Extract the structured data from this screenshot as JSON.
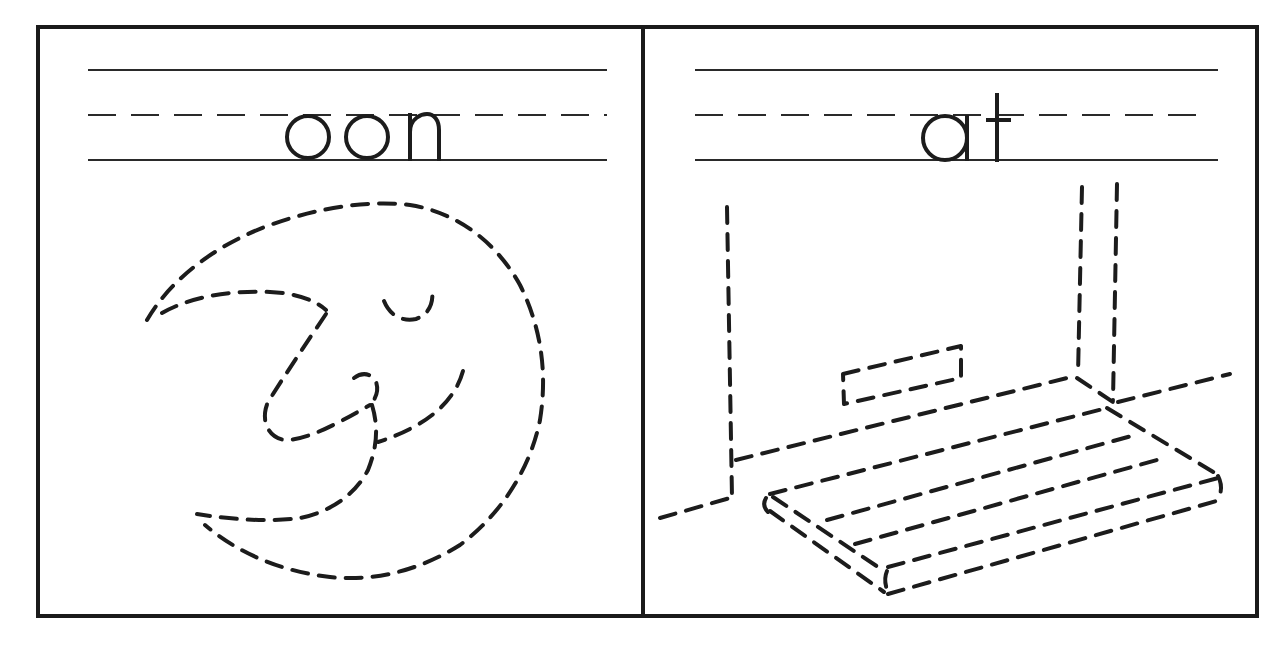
{
  "worksheet": {
    "type": "word-family tracing worksheet",
    "panels": [
      {
        "id": "left",
        "word": "oon",
        "letters": [
          "o",
          "o",
          "n"
        ],
        "picture": "moon-face",
        "picture_style": "dashed tracing outline"
      },
      {
        "id": "right",
        "word": "at",
        "letters": [
          "a",
          "t"
        ],
        "picture": "room-with-mat",
        "picture_style": "dashed tracing outline"
      }
    ],
    "colors": {
      "ink": "#1c1c1c",
      "paper": "#ffffff"
    }
  }
}
